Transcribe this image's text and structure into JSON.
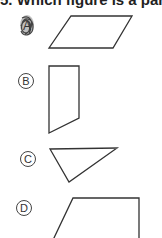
{
  "question": {
    "text": "5. Which figure is a parallelogram?"
  },
  "options": [
    {
      "label": "A",
      "shape": "parallelogram",
      "selected": true,
      "marker": "scribbled-circle"
    },
    {
      "label": "B",
      "shape": "trapezoid-vertical"
    },
    {
      "label": "C",
      "shape": "triangle"
    },
    {
      "label": "D",
      "shape": "trapezoid-right"
    }
  ],
  "colors": {
    "ink": "#333333",
    "scribble": "#555555",
    "background": "#ffffff"
  }
}
